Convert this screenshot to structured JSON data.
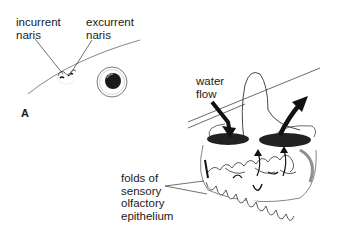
{
  "figure": {
    "panel_label": "A",
    "left_panel": {
      "labels": {
        "incurrent": "incurrent\nnaris",
        "excurrent": "excurrent\nnaris"
      }
    },
    "right_panel": {
      "labels": {
        "water_flow": "water\nflow",
        "folds": "folds of\nsensory\nolfactory\nepithelium"
      }
    },
    "colors": {
      "ink": "#1a1a1a",
      "line": "#555555",
      "shade": "#2a2a2a"
    }
  }
}
